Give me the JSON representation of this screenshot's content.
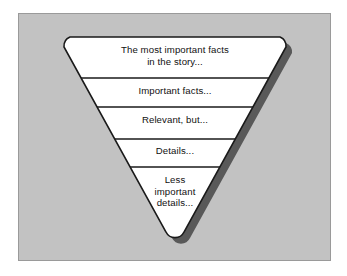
{
  "figure": {
    "type": "inverted-pyramid",
    "background_color": "#c2c2c2",
    "shape_fill": "#ffffff",
    "shape_outline": "#1a1a1a",
    "shadow_color": "#595959",
    "bands": [
      {
        "id": "band-1",
        "label": "The most important facts\nin the story..."
      },
      {
        "id": "band-2",
        "label": "Important facts..."
      },
      {
        "id": "band-3",
        "label": "Relevant, but..."
      },
      {
        "id": "band-4",
        "label": "Details..."
      },
      {
        "id": "band-5",
        "label": "Less\nimportant\ndetails..."
      }
    ]
  }
}
